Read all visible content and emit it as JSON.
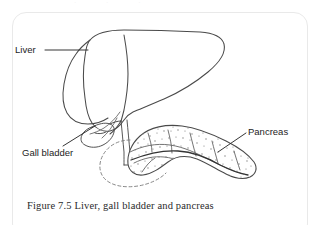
{
  "figure": {
    "caption": "Figure 7.5 Liver, gall bladder and pancreas",
    "top_remnant": "· · ·",
    "labels": [
      {
        "id": "liver",
        "text": "Liver",
        "leader": "horizontal-right"
      },
      {
        "id": "gall",
        "text": "Gall bladder",
        "leader": "diagonal-up-right"
      },
      {
        "id": "pancreas",
        "text": "Pancreas",
        "leader": "diagonal-down-left"
      }
    ],
    "structures": [
      {
        "name": "liver",
        "style": "outline",
        "description": "large two-lobed organ, upper left"
      },
      {
        "name": "gall-bladder",
        "style": "outline",
        "description": "small pear-shaped sac beneath the liver"
      },
      {
        "name": "bile-duct",
        "style": "outline",
        "description": "narrow tube from liver hilum down to pancreas head"
      },
      {
        "name": "duodenum",
        "style": "dashed",
        "description": "dashed C-shaped loop around the pancreas head"
      },
      {
        "name": "pancreas",
        "style": "stippled",
        "description": "elongated lobulated gland with internal duct, to the right"
      }
    ],
    "colors": {
      "ink": "#4a4a4a",
      "ink_dark": "#333333",
      "stipple": "#7d7d7d",
      "card_border": "#e9e9e9",
      "background": "#ffffff",
      "label_text": "#1d1d1d",
      "caption_text": "#2a2a2a"
    }
  }
}
